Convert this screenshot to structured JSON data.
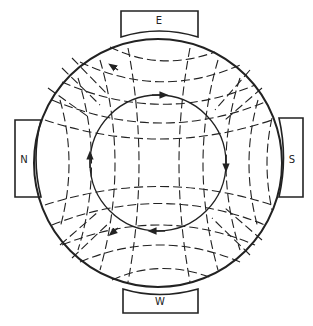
{
  "diagram": {
    "title": "",
    "magnets": {
      "top": {
        "label": "E"
      },
      "bottom": {
        "label": "W"
      },
      "left": {
        "label": "N"
      },
      "right": {
        "label": "S"
      }
    },
    "line_color": "#222222",
    "background": "#ffffff",
    "elements": {
      "outer_circle": "outer-boundary-circle",
      "inner_circle": "circulation-path-with-arrows",
      "field_lines": "dashed-field-lines"
    }
  }
}
